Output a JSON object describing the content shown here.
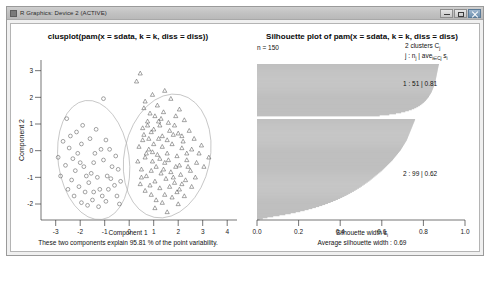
{
  "window": {
    "title": "R Graphics: Device 2 (ACTIVE)",
    "icon": "r-graphics-icon",
    "buttons": {
      "minimize": "minimize-button",
      "maximize": "maximize-button",
      "close": "close-button"
    }
  },
  "left_panel": {
    "title": "clusplot(pam(x = sdata, k = k, diss = diss))",
    "xlabel": "Component 1",
    "ylabel": "Component 2",
    "footer": "These two components explain 95.81 % of the point variability.",
    "xticks": [
      "-3",
      "-2",
      "-1",
      "0",
      "1",
      "2",
      "3",
      "4"
    ],
    "yticks": [
      "3",
      "2",
      "1",
      "0",
      "-1",
      "-2"
    ]
  },
  "right_panel": {
    "title": "Silhouette plot of pam(x = sdata, k = k, diss = diss)",
    "n_label": "n = 150",
    "clusters_label": "2 clusters  C",
    "clusters_label_sub": "j",
    "legend_j": "j :  n",
    "legend_j_sub": "j",
    "legend_mid": " | ave",
    "legend_mid_sub": "i∈Cj",
    "legend_end": " s",
    "legend_end_sub": "i",
    "cluster1_label": "1 :  51  |  0.81",
    "cluster2_label": "2 :  99  |  0.62",
    "xlabel": "Silhouette width s",
    "xlabel_sub": "i",
    "footer": "Average silhouette width :  0.69",
    "xticks": [
      "0.0",
      "0.2",
      "0.4",
      "0.6",
      "0.8",
      "1.0"
    ]
  },
  "chart_data": [
    {
      "type": "scatter",
      "title": "clusplot(pam(x = sdata, k = k, diss = diss))",
      "xlabel": "Component 1",
      "ylabel": "Component 2",
      "xlim": [
        -3.6,
        4.4
      ],
      "ylim": [
        -2.6,
        3.4
      ],
      "grid": false,
      "legend": "none",
      "annotation": "These two components explain 95.81 % of the point variability.",
      "series": [
        {
          "name": "cluster 1",
          "marker": "circle",
          "n": 51,
          "points": [
            [
              -2.55,
              1.2
            ],
            [
              -2.7,
              0.35
            ],
            [
              -2.45,
              0.1
            ],
            [
              -2.3,
              -0.3
            ],
            [
              -2.6,
              -0.55
            ],
            [
              -2.2,
              -0.75
            ],
            [
              -2.0,
              -0.45
            ],
            [
              -2.1,
              -0.1
            ],
            [
              -1.95,
              0.25
            ],
            [
              -1.85,
              -0.6
            ],
            [
              -1.75,
              -0.95
            ],
            [
              -2.35,
              -1.1
            ],
            [
              -2.05,
              -1.35
            ],
            [
              -1.8,
              -1.55
            ],
            [
              -1.65,
              -1.2
            ],
            [
              -1.55,
              -0.85
            ],
            [
              -1.45,
              -0.45
            ],
            [
              -1.4,
              -0.1
            ],
            [
              -1.3,
              -1.0
            ],
            [
              -1.2,
              -1.45
            ],
            [
              -1.1,
              -1.7
            ],
            [
              -1.5,
              -1.85
            ],
            [
              -1.95,
              -1.95
            ],
            [
              -2.25,
              -1.7
            ],
            [
              -1.7,
              -2.05
            ],
            [
              -1.25,
              -2.1
            ],
            [
              -0.95,
              -1.9
            ],
            [
              -0.85,
              -1.45
            ],
            [
              -0.75,
              -1.05
            ],
            [
              -0.7,
              -0.6
            ],
            [
              -0.6,
              -1.3
            ],
            [
              -0.5,
              -1.7
            ],
            [
              -0.4,
              -2.0
            ],
            [
              -1.05,
              -0.35
            ],
            [
              -1.15,
              0.05
            ],
            [
              -1.6,
              0.45
            ],
            [
              -2.15,
              0.7
            ],
            [
              -1.9,
              0.95
            ],
            [
              -1.35,
              0.8
            ],
            [
              -0.95,
              0.4
            ],
            [
              -0.8,
              0.05
            ],
            [
              -2.8,
              -0.95
            ],
            [
              -2.5,
              -1.45
            ],
            [
              -2.9,
              -0.25
            ],
            [
              -1.05,
              1.95
            ],
            [
              -0.55,
              -0.2
            ],
            [
              -0.45,
              -0.7
            ],
            [
              -0.35,
              -1.15
            ],
            [
              -1.45,
              -1.55
            ],
            [
              -0.9,
              -0.95
            ],
            [
              -2.4,
              0.55
            ]
          ]
        },
        {
          "name": "cluster 2",
          "marker": "triangle",
          "n": 99,
          "points": [
            [
              0.6,
              1.6
            ],
            [
              0.75,
              1.1
            ],
            [
              0.55,
              0.85
            ],
            [
              0.9,
              0.7
            ],
            [
              1.05,
              1.3
            ],
            [
              1.25,
              0.95
            ],
            [
              1.4,
              1.45
            ],
            [
              1.6,
              1.05
            ],
            [
              1.8,
              0.6
            ],
            [
              1.2,
              0.45
            ],
            [
              1.0,
              0.25
            ],
            [
              0.8,
              0.05
            ],
            [
              0.65,
              -0.25
            ],
            [
              0.95,
              -0.4
            ],
            [
              1.15,
              -0.15
            ],
            [
              1.35,
              0.15
            ],
            [
              1.55,
              -0.1
            ],
            [
              1.75,
              0.25
            ],
            [
              1.95,
              -0.2
            ],
            [
              2.15,
              0.1
            ],
            [
              2.35,
              -0.35
            ],
            [
              2.55,
              0.05
            ],
            [
              2.75,
              -0.45
            ],
            [
              2.95,
              0.2
            ],
            [
              0.5,
              -0.7
            ],
            [
              0.7,
              -0.95
            ],
            [
              0.9,
              -0.75
            ],
            [
              1.1,
              -0.6
            ],
            [
              1.3,
              -0.85
            ],
            [
              1.5,
              -1.05
            ],
            [
              1.7,
              -0.8
            ],
            [
              1.9,
              -0.6
            ],
            [
              2.1,
              -0.9
            ],
            [
              2.3,
              -1.1
            ],
            [
              2.5,
              -0.75
            ],
            [
              2.7,
              -1.0
            ],
            [
              0.45,
              -1.25
            ],
            [
              0.65,
              -1.5
            ],
            [
              0.85,
              -1.3
            ],
            [
              1.05,
              -1.15
            ],
            [
              1.25,
              -1.4
            ],
            [
              1.45,
              -1.65
            ],
            [
              1.65,
              -1.35
            ],
            [
              1.85,
              -1.2
            ],
            [
              2.05,
              -1.45
            ],
            [
              2.25,
              -1.7
            ],
            [
              0.55,
              0.4
            ],
            [
              0.4,
              0.15
            ],
            [
              0.35,
              -0.4
            ],
            [
              1.45,
              2.25
            ],
            [
              1.7,
              1.95
            ],
            [
              0.95,
              2.1
            ],
            [
              0.3,
              2.6
            ],
            [
              0.45,
              2.9
            ],
            [
              2.05,
              1.55
            ],
            [
              2.25,
              1.15
            ],
            [
              2.45,
              0.75
            ],
            [
              2.65,
              0.45
            ],
            [
              2.85,
              -0.1
            ],
            [
              3.05,
              -0.6
            ],
            [
              3.25,
              -0.25
            ],
            [
              1.05,
              -2.15
            ],
            [
              1.55,
              -2.3
            ],
            [
              2.0,
              -2.0
            ],
            [
              0.75,
              0.95
            ],
            [
              1.15,
              1.7
            ],
            [
              1.35,
              0.55
            ],
            [
              1.55,
              0.4
            ],
            [
              0.85,
              1.4
            ],
            [
              0.6,
              0.6
            ],
            [
              1.9,
              1.3
            ],
            [
              2.15,
              0.55
            ],
            [
              0.95,
              -0.05
            ],
            [
              1.25,
              -0.3
            ],
            [
              1.45,
              -0.45
            ],
            [
              1.65,
              0.75
            ],
            [
              1.85,
              0.95
            ],
            [
              2.05,
              -0.55
            ],
            [
              0.7,
              -0.1
            ],
            [
              0.5,
              -1.0
            ],
            [
              1.1,
              -1.85
            ],
            [
              1.35,
              -1.95
            ],
            [
              0.9,
              -1.65
            ],
            [
              2.35,
              -0.1
            ],
            [
              2.55,
              -1.35
            ],
            [
              1.75,
              -1.75
            ],
            [
              1.95,
              -1.55
            ],
            [
              2.15,
              -1.25
            ],
            [
              0.8,
              0.45
            ],
            [
              1.0,
              0.8
            ],
            [
              1.2,
              1.1
            ],
            [
              1.4,
              -0.7
            ],
            [
              1.6,
              -0.35
            ],
            [
              1.8,
              -1.0
            ],
            [
              2.0,
              0.65
            ],
            [
              2.2,
              0.35
            ],
            [
              2.4,
              -0.6
            ],
            [
              0.65,
              1.85
            ],
            [
              1.3,
              1.2
            ]
          ]
        }
      ],
      "ellipses": [
        {
          "cx": -1.45,
          "cy": -0.35,
          "rx": 1.45,
          "ry": 2.25,
          "rot": -8
        },
        {
          "cx": 1.55,
          "cy": -0.2,
          "rx": 1.75,
          "ry": 2.35,
          "rot": 12
        }
      ]
    },
    {
      "type": "bar",
      "orientation": "horizontal",
      "title": "Silhouette plot of pam(x = sdata, k = k, diss = diss)",
      "xlabel": "Silhouette width s_i",
      "xlim": [
        0.0,
        1.0
      ],
      "n": 150,
      "n_clusters": 2,
      "average_silhouette_width": 0.69,
      "grid": false,
      "legend": "none",
      "clusters": [
        {
          "id": 1,
          "size": 51,
          "avg_silhouette": 0.81
        },
        {
          "id": 2,
          "size": 99,
          "avg_silhouette": 0.62
        }
      ],
      "cluster1_widths": [
        0.875,
        0.873,
        0.872,
        0.871,
        0.87,
        0.869,
        0.868,
        0.867,
        0.866,
        0.865,
        0.864,
        0.863,
        0.862,
        0.861,
        0.86,
        0.859,
        0.858,
        0.857,
        0.856,
        0.855,
        0.853,
        0.851,
        0.849,
        0.847,
        0.845,
        0.843,
        0.841,
        0.839,
        0.836,
        0.833,
        0.83,
        0.827,
        0.824,
        0.82,
        0.816,
        0.812,
        0.807,
        0.802,
        0.796,
        0.79,
        0.783,
        0.775,
        0.766,
        0.756,
        0.744,
        0.73,
        0.713,
        0.693,
        0.668,
        0.636,
        0.59
      ],
      "cluster2_widths": [
        0.76,
        0.758,
        0.756,
        0.754,
        0.752,
        0.75,
        0.748,
        0.746,
        0.744,
        0.742,
        0.74,
        0.738,
        0.736,
        0.734,
        0.732,
        0.73,
        0.728,
        0.726,
        0.724,
        0.722,
        0.72,
        0.717,
        0.714,
        0.711,
        0.708,
        0.705,
        0.702,
        0.699,
        0.696,
        0.693,
        0.69,
        0.686,
        0.682,
        0.678,
        0.674,
        0.67,
        0.666,
        0.662,
        0.658,
        0.654,
        0.65,
        0.645,
        0.64,
        0.635,
        0.63,
        0.625,
        0.62,
        0.615,
        0.61,
        0.605,
        0.6,
        0.594,
        0.588,
        0.582,
        0.576,
        0.57,
        0.564,
        0.558,
        0.552,
        0.546,
        0.54,
        0.533,
        0.526,
        0.519,
        0.512,
        0.505,
        0.498,
        0.49,
        0.482,
        0.474,
        0.466,
        0.457,
        0.448,
        0.439,
        0.43,
        0.42,
        0.41,
        0.4,
        0.389,
        0.378,
        0.366,
        0.354,
        0.341,
        0.328,
        0.314,
        0.299,
        0.283,
        0.266,
        0.248,
        0.229,
        0.208,
        0.186,
        0.162,
        0.136,
        0.108,
        0.078,
        0.05,
        0.028,
        0.012
      ]
    }
  ]
}
